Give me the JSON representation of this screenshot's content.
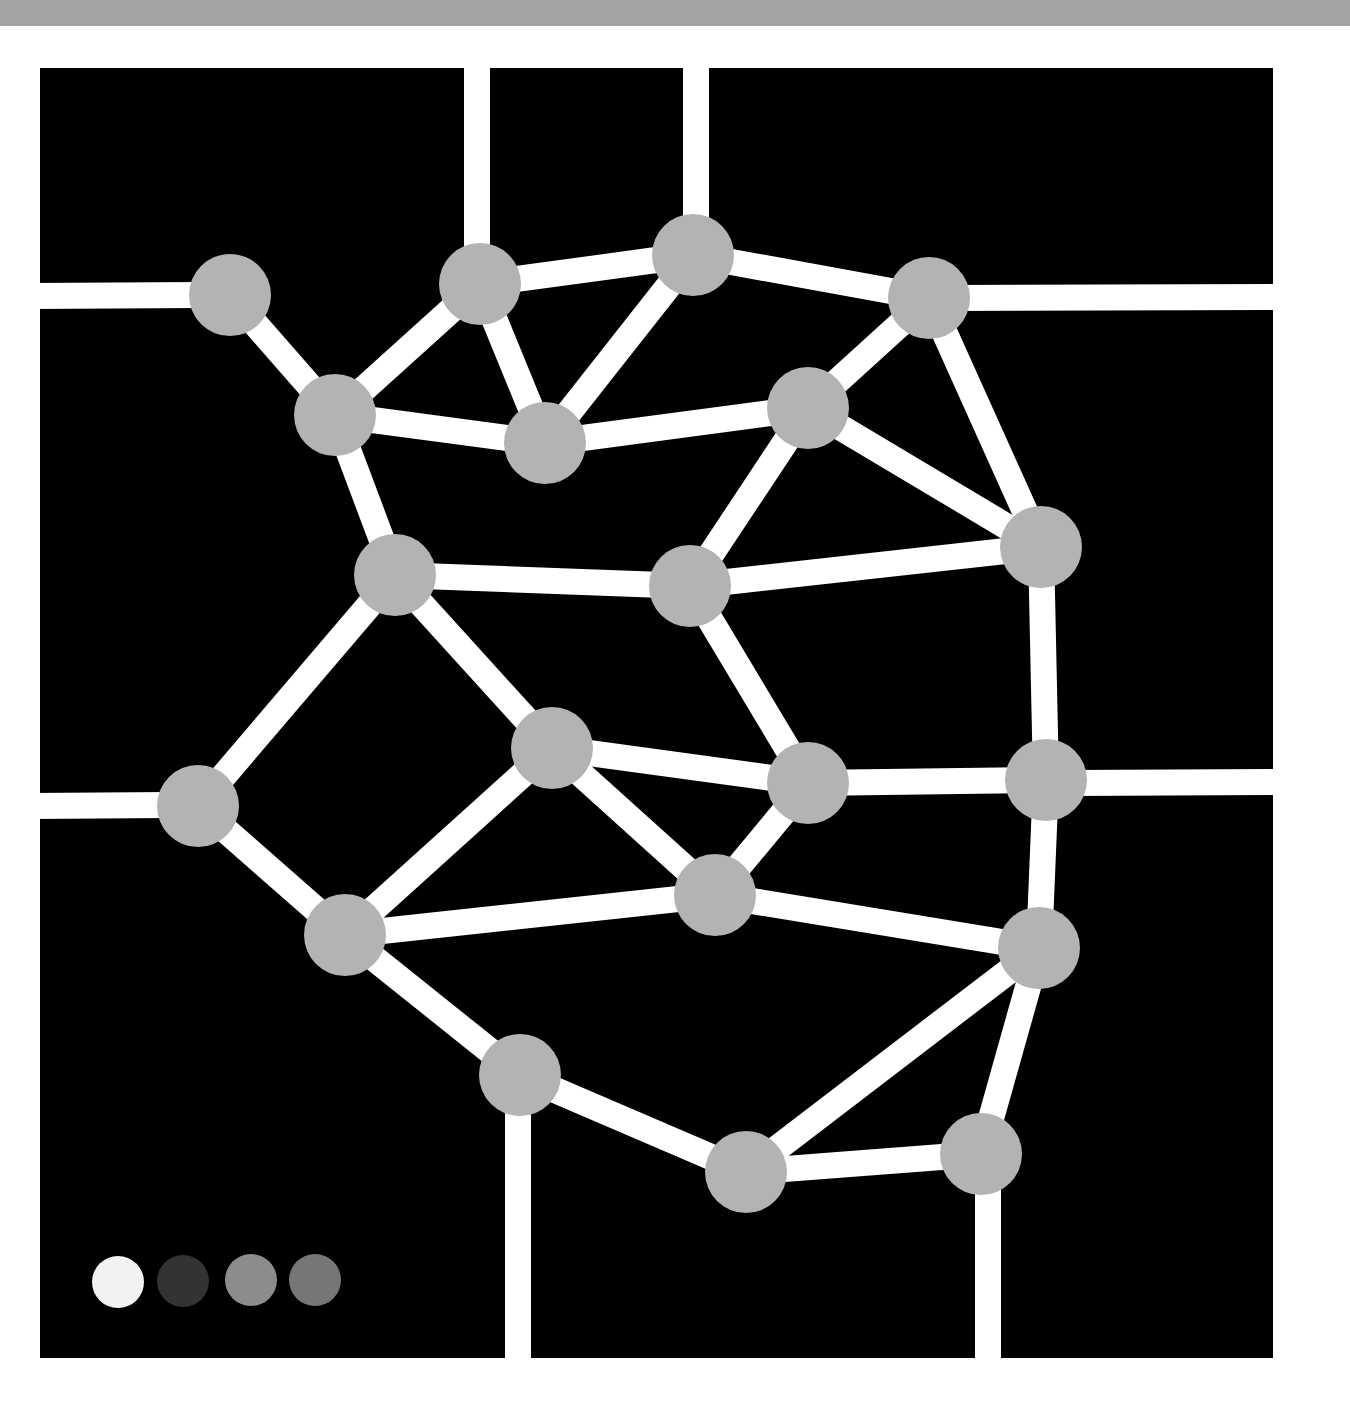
{
  "colors": {
    "background": "#000000",
    "page": "#ffffff",
    "top_strip": "#a3a3a3",
    "line": "#ffffff",
    "node": "#b3b3b3"
  },
  "frame": {
    "x": 40,
    "y": 68,
    "width": 1233,
    "height": 1290
  },
  "line_width": 26,
  "node_radius": 41,
  "grid_lines": [
    {
      "id": "g-top-1",
      "x1": 477,
      "y1": 60,
      "x2": 477,
      "y2": 260
    },
    {
      "id": "g-top-2",
      "x1": 696,
      "y1": 60,
      "x2": 696,
      "y2": 240
    },
    {
      "id": "g-left-1",
      "x1": 30,
      "y1": 296,
      "x2": 200,
      "y2": 295
    },
    {
      "id": "g-right-1",
      "x1": 950,
      "y1": 298,
      "x2": 1285,
      "y2": 297
    },
    {
      "id": "g-left-2",
      "x1": 30,
      "y1": 806,
      "x2": 170,
      "y2": 805
    },
    {
      "id": "g-right-2",
      "x1": 1070,
      "y1": 783,
      "x2": 1285,
      "y2": 782
    },
    {
      "id": "g-bottom-1",
      "x1": 518,
      "y1": 1100,
      "x2": 518,
      "y2": 1370
    },
    {
      "id": "g-bottom-2",
      "x1": 988,
      "y1": 1180,
      "x2": 988,
      "y2": 1370
    }
  ],
  "nodes": [
    {
      "id": "n1",
      "x": 230,
      "y": 295
    },
    {
      "id": "n2",
      "x": 480,
      "y": 284
    },
    {
      "id": "n3",
      "x": 693,
      "y": 255
    },
    {
      "id": "n4",
      "x": 929,
      "y": 298
    },
    {
      "id": "n5",
      "x": 335,
      "y": 415
    },
    {
      "id": "n6",
      "x": 545,
      "y": 443
    },
    {
      "id": "n7",
      "x": 808,
      "y": 408
    },
    {
      "id": "n8",
      "x": 1041,
      "y": 547
    },
    {
      "id": "n9",
      "x": 395,
      "y": 575
    },
    {
      "id": "n10",
      "x": 690,
      "y": 586
    },
    {
      "id": "n11",
      "x": 552,
      "y": 748
    },
    {
      "id": "n12",
      "x": 198,
      "y": 806
    },
    {
      "id": "n13",
      "x": 808,
      "y": 783
    },
    {
      "id": "n14",
      "x": 1046,
      "y": 780
    },
    {
      "id": "n15",
      "x": 715,
      "y": 895
    },
    {
      "id": "n16",
      "x": 345,
      "y": 935
    },
    {
      "id": "n17",
      "x": 1039,
      "y": 948
    },
    {
      "id": "n18",
      "x": 520,
      "y": 1075
    },
    {
      "id": "n19",
      "x": 746,
      "y": 1172
    },
    {
      "id": "n20",
      "x": 981,
      "y": 1154
    }
  ],
  "edges": [
    [
      "n1",
      "n5"
    ],
    [
      "n2",
      "n5"
    ],
    [
      "n2",
      "n3"
    ],
    [
      "n2",
      "n6"
    ],
    [
      "n3",
      "n6"
    ],
    [
      "n3",
      "n4"
    ],
    [
      "n4",
      "n7"
    ],
    [
      "n4",
      "n8"
    ],
    [
      "n5",
      "n6"
    ],
    [
      "n6",
      "n7"
    ],
    [
      "n7",
      "n8"
    ],
    [
      "n7",
      "n10"
    ],
    [
      "n5",
      "n9"
    ],
    [
      "n9",
      "n10"
    ],
    [
      "n10",
      "n8"
    ],
    [
      "n9",
      "n12"
    ],
    [
      "n9",
      "n11"
    ],
    [
      "n10",
      "n13"
    ],
    [
      "n11",
      "n13"
    ],
    [
      "n11",
      "n15"
    ],
    [
      "n11",
      "n16"
    ],
    [
      "n12",
      "n16"
    ],
    [
      "n13",
      "n15"
    ],
    [
      "n13",
      "n14"
    ],
    [
      "n8",
      "n14"
    ],
    [
      "n14",
      "n17"
    ],
    [
      "n15",
      "n17"
    ],
    [
      "n16",
      "n15"
    ],
    [
      "n16",
      "n18"
    ],
    [
      "n18",
      "n19"
    ],
    [
      "n19",
      "n17"
    ],
    [
      "n19",
      "n20"
    ],
    [
      "n17",
      "n20"
    ]
  ],
  "legend_swatches": [
    {
      "id": "swatch-white",
      "x": 118,
      "y": 1282,
      "r": 26,
      "color": "#f2f2f2"
    },
    {
      "id": "swatch-dark-gray",
      "x": 183,
      "y": 1281,
      "r": 26,
      "color": "#333333"
    },
    {
      "id": "swatch-mid-gray",
      "x": 251,
      "y": 1280,
      "r": 26,
      "color": "#8c8c8c"
    },
    {
      "id": "swatch-gray",
      "x": 315,
      "y": 1280,
      "r": 26,
      "color": "#767676"
    }
  ]
}
